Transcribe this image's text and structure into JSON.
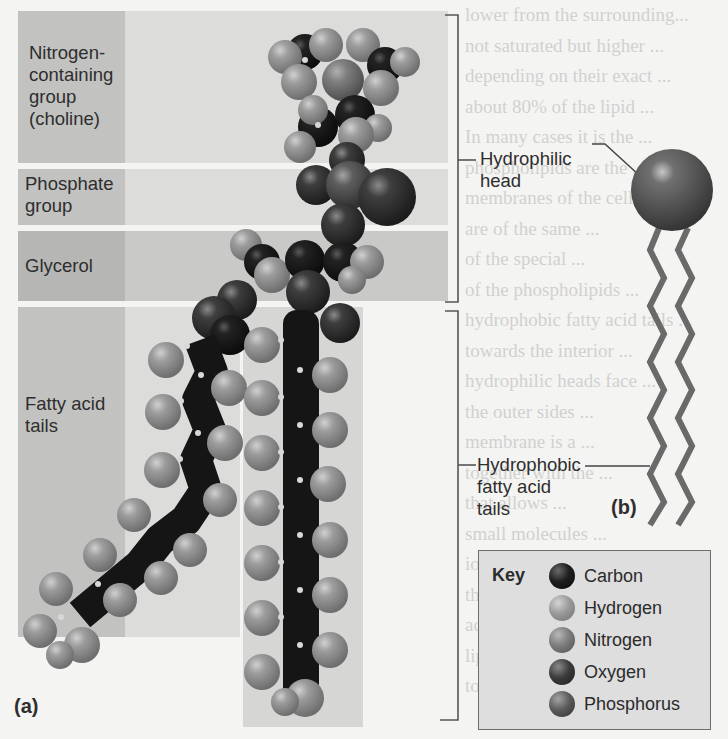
{
  "figure": {
    "panel_a": {
      "letter": "(a)",
      "regions": [
        {
          "label_line1": "Nitrogen-",
          "label_line2": "containing",
          "label_line3": "group",
          "label_line4": "(choline)"
        },
        {
          "label_line1": "Phosphate",
          "label_line2": "group"
        },
        {
          "label_line1": "Glycerol"
        },
        {
          "label_line1": "Fatty acid",
          "label_line2": "tails"
        }
      ]
    },
    "annotations": {
      "head_line1": "Hydrophilic",
      "head_line2": "head",
      "tails_line1": "Hydrophobic",
      "tails_line2": "fatty acid",
      "tails_line3": "tails"
    },
    "panel_b": {
      "letter": "(b)"
    },
    "key": {
      "title": "Key",
      "items": [
        {
          "label": "Carbon",
          "color": "#1e1e1e"
        },
        {
          "label": "Hydrogen",
          "color": "#9a9a9a"
        },
        {
          "label": "Nitrogen",
          "color": "#7d7d7d"
        },
        {
          "label": "Oxygen",
          "color": "#3c3c3c"
        },
        {
          "label": "Phosphorus",
          "color": "#5c5c5c"
        }
      ]
    },
    "colors": {
      "carbon": "#1e1e1e",
      "hydrogen": "#9a9a9a",
      "nitrogen": "#7d7d7d",
      "oxygen": "#3c3c3c",
      "phosphorus": "#5c5c5c",
      "head_sphere": "#5e5e5e",
      "tail_line": "#6a6a6a"
    },
    "background_text_lines": [
      "lower from the surrounding...",
      "not saturated but higher ...",
      "depending on their exact ...",
      "about 80% of the lipid ...",
      "In many cases it is the ...",
      "phospholipids are the ...",
      "membranes of the cell ...",
      "are of the same ...",
      "of the special ...",
      "of the phospholipids ...",
      "hydrophobic fatty acid tails ...",
      "towards the interior ...",
      "hydrophilic heads face ...",
      "the outer sides ...",
      "membrane is a ...",
      "together with the ...",
      "that allows ...",
      "small molecules ...",
      "ions and the ...",
      "the cell ...",
      "across the ...",
      "lipid layers ...",
      "together to seal the break"
    ]
  }
}
